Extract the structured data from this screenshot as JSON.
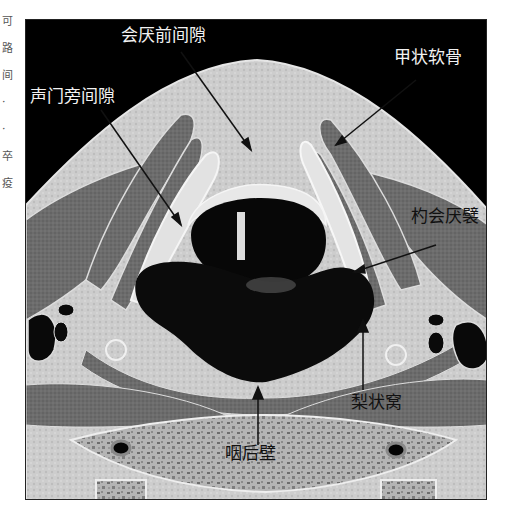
{
  "margin_fragments": [
    "可",
    "路",
    "间",
    "·",
    "·",
    "卒",
    "疫"
  ],
  "figure": {
    "labels": {
      "pre_epiglottic_space": "会厌前间隙",
      "thyroid_cartilage": "甲状软骨",
      "paraglottic_space": "声门旁间隙",
      "aryepiglottic_fold": "杓会厌襞",
      "piriform_sinus": "梨状窝",
      "posterior_pharyngeal_wall": "咽后壁"
    },
    "colors": {
      "background": "#000000",
      "soft_tissue": "#cfcfcf",
      "muscle": "#6e6e6e",
      "cartilage": "#e4e4e4",
      "airway": "#0a0a0a",
      "vertebra": "#a9a9a9",
      "label_light": "#f2f2f2",
      "label_dark": "#111111"
    }
  }
}
